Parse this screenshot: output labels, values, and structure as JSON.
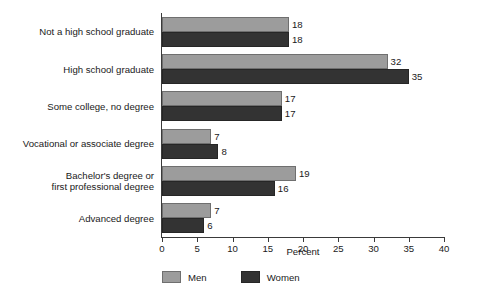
{
  "chart_data": {
    "type": "bar",
    "orientation": "horizontal",
    "title": "",
    "xlabel": "Percent",
    "ylabel": "",
    "xlim": [
      0,
      40
    ],
    "xticks": [
      0,
      5,
      10,
      15,
      20,
      25,
      30,
      35,
      40
    ],
    "grid": false,
    "legend_position": "bottom-left",
    "categories": [
      "Not a high school graduate",
      "High school graduate",
      "Some college, no degree",
      "Vocational or associate degree",
      "Bachelor's degree or\nfirst professional degree",
      "Advanced degree"
    ],
    "series": [
      {
        "name": "Men",
        "color": "#9c9c9c",
        "values": [
          18,
          32,
          17,
          7,
          19,
          7
        ]
      },
      {
        "name": "Women",
        "color": "#333333",
        "values": [
          18,
          35,
          17,
          8,
          16,
          6
        ]
      }
    ],
    "data_labels": [
      [
        "18",
        "32",
        "17",
        "7",
        "19",
        "7"
      ],
      [
        "18",
        "35",
        "17",
        "8",
        "16",
        "6"
      ]
    ]
  },
  "legend": {
    "items": [
      {
        "label": "Men"
      },
      {
        "label": "Women"
      }
    ]
  },
  "axis": {
    "x_title": "Percent",
    "tick_labels": [
      "0",
      "5",
      "10",
      "15",
      "20",
      "25",
      "30",
      "35",
      "40"
    ]
  }
}
